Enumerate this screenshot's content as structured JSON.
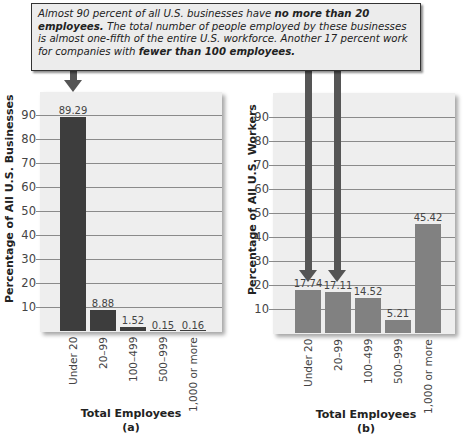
{
  "callout": {
    "parts": [
      {
        "text": "Almost 90 percent of all U.S. businesses have ",
        "bold": false
      },
      {
        "text": "no more than 20 employees.",
        "bold": true
      },
      {
        "text": " The total number of people employed by these businesses is almost one-fifth of the entire U.S. workforce. Another 17 percent work for companies with ",
        "bold": false
      },
      {
        "text": "fewer than 100 employees.",
        "bold": true
      }
    ]
  },
  "colors": {
    "panel_a_bar": "#3d3d3d",
    "panel_b_bar": "#818181",
    "arrow": "#555555",
    "panel_bg": "#eeeeee"
  },
  "chart_data": [
    {
      "type": "bar",
      "title": "",
      "panel_label": "(a)",
      "xlabel": "Total Employees",
      "ylabel": "Percentage of All U.S. Businesses",
      "categories": [
        "Under 20",
        "20–99",
        "100–499",
        "500–999",
        "1,000 or more"
      ],
      "values": [
        89.29,
        8.88,
        1.52,
        0.15,
        0.16
      ],
      "value_labels": [
        "89.29",
        "8.88",
        "1.52",
        "0.15",
        "0.16"
      ],
      "yticks": [
        10,
        20,
        30,
        40,
        50,
        60,
        70,
        80,
        90
      ],
      "ylim": [
        0,
        95
      ],
      "grid": true,
      "annotations": [
        "Arrow pointing to Under 20 bar"
      ]
    },
    {
      "type": "bar",
      "title": "",
      "panel_label": "(b)",
      "xlabel": "Total Employees",
      "ylabel": "Percentage of All U.S. Workers",
      "categories": [
        "Under 20",
        "20–99",
        "100–499",
        "500–999",
        "1,000 or more"
      ],
      "values": [
        17.74,
        17.11,
        14.52,
        5.21,
        45.42
      ],
      "value_labels": [
        "17.74",
        "17.11",
        "14.52",
        "5.21",
        "45.42"
      ],
      "yticks": [
        10,
        20,
        30,
        40,
        50,
        60,
        70,
        80,
        90
      ],
      "ylim": [
        0,
        95
      ],
      "grid": true,
      "annotations": [
        "Arrows pointing to Under 20 and 20–99 bars"
      ]
    }
  ]
}
